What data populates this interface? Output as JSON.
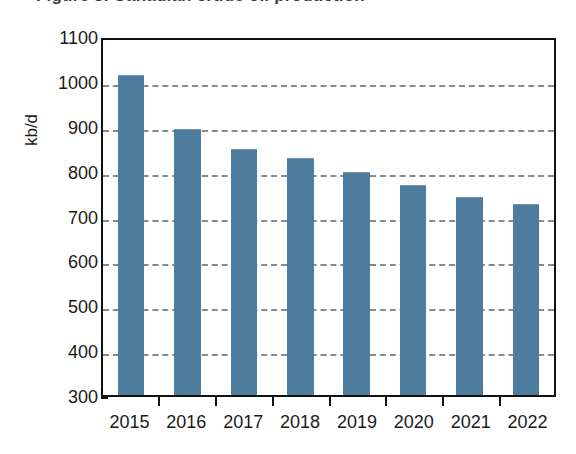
{
  "figure": {
    "title": "Figure 3.  Canadian crude oil production",
    "background_color": "#ffffff"
  },
  "axes": {
    "y_unit_label": "kb/d",
    "y_ticks": [
      "1100",
      "1000",
      "900",
      "800",
      "700",
      "600",
      "500",
      "400",
      "300"
    ],
    "x_ticks": [
      "2015",
      "2016",
      "2017",
      "2018",
      "2019",
      "2020",
      "2021",
      "2022"
    ]
  },
  "style": {
    "bar_color": "#4e7c9e",
    "gridline_color": "#8a8a8a",
    "frame_color": "#111111",
    "text_color": "#1a1a1a"
  },
  "chart_data": {
    "type": "bar",
    "title": "Figure 3.  Canadian crude oil production",
    "xlabel": "",
    "ylabel": "kb/d",
    "categories": [
      "2015",
      "2016",
      "2017",
      "2018",
      "2019",
      "2020",
      "2021",
      "2022"
    ],
    "values": [
      1010,
      890,
      845,
      825,
      795,
      765,
      738,
      723
    ],
    "ylim": [
      300,
      1100
    ],
    "ytick_step": 100,
    "grid": true,
    "grid_axis": "y",
    "grid_style": "dashed",
    "legend": false,
    "legend_position": "none",
    "series": [
      {
        "name": "kb/d",
        "color": "#4e7c9e",
        "values": [
          1010,
          890,
          845,
          825,
          795,
          765,
          738,
          723
        ]
      }
    ]
  }
}
